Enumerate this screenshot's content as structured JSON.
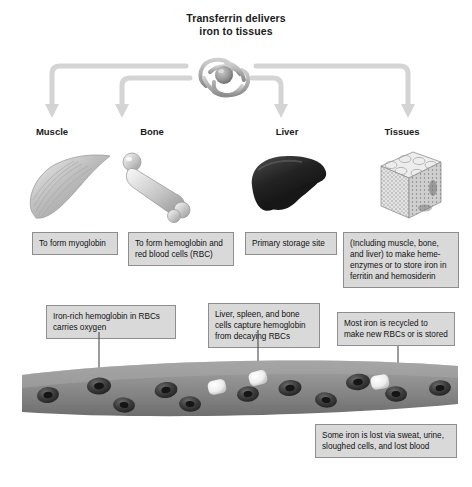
{
  "diagram": {
    "title_line1": "Transferrin delivers",
    "title_line2": "iron to tissues",
    "central_icon": "transferrin-molecule-icon",
    "colors": {
      "box_fill": "#d9d9d9",
      "box_border": "#8e8e8e",
      "arrow": "#d2d2d2",
      "vessel_top": "#9d9d9d",
      "vessel_bottom": "#6f6f6f",
      "rbc": "#4a4a4a",
      "white_cell": "#f2f2f2",
      "text": "#1a1a1a"
    },
    "destinations": [
      {
        "label": "Muscle",
        "icon": "muscle-icon",
        "caption": "To form myoglobin"
      },
      {
        "label": "Bone",
        "icon": "bone-icon",
        "caption": "To form hemoglobin and red blood cells (RBC)"
      },
      {
        "label": "Liver",
        "icon": "liver-icon",
        "caption": "Primary storage site"
      },
      {
        "label": "Tissues",
        "icon": "tissue-cube-icon",
        "caption": "(Including muscle, bone, and liver) to make heme-enzymes or to store iron in ferritin and hemosiderin"
      }
    ],
    "callouts": [
      {
        "name": "callout-hemoglobin-oxygen",
        "text": "Iron-rich hemoglobin in RBCs carries oxygen"
      },
      {
        "name": "callout-capture-hemoglobin",
        "text": "Liver, spleen, and bone cells capture hemoglobin from decaying RBCs"
      },
      {
        "name": "callout-recycled-iron",
        "text": "Most iron is recycled to make new RBCs or is stored"
      },
      {
        "name": "callout-iron-loss",
        "text": "Some iron is lost via sweat, urine, sloughed cells, and lost blood"
      }
    ],
    "blood_vessel": {
      "name": "blood-vessel",
      "red_blood_cell_count": 11,
      "white_blood_cell_count": 3
    }
  }
}
